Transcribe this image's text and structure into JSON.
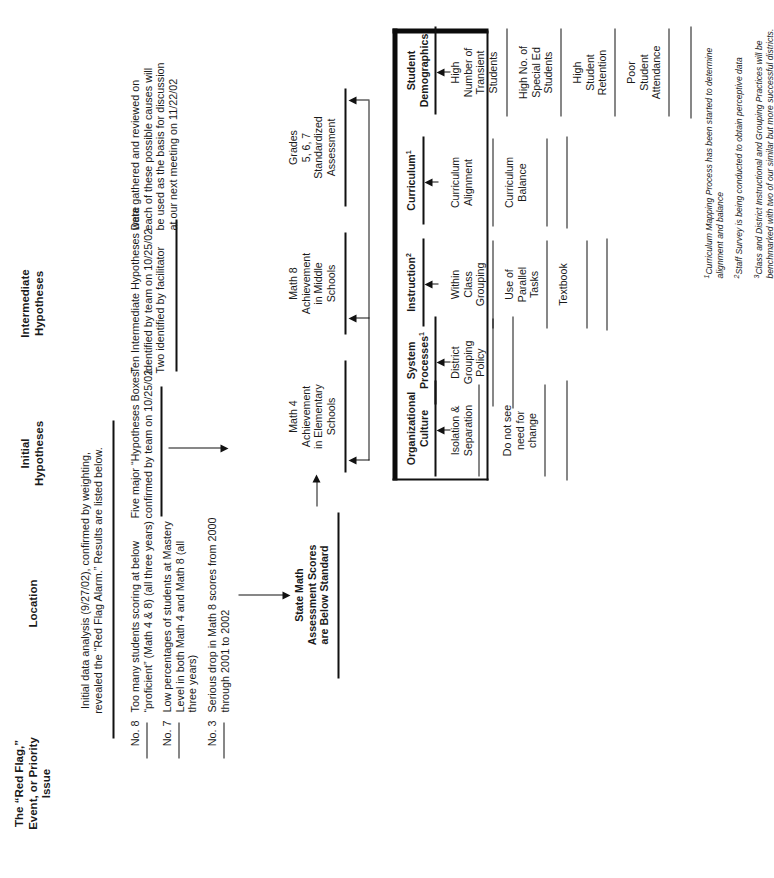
{
  "columns": [
    {
      "id": "red-flag",
      "label": "The “Red Flag,”\nEvent, or Priority\nIssue"
    },
    {
      "id": "location",
      "label": "Location"
    },
    {
      "id": "initial",
      "label": "Initial\nHypotheses"
    },
    {
      "id": "intermediate",
      "label": "Intermediate\nHypotheses"
    }
  ],
  "analysis_note": "Initial data analysis (9/27/02), confirmed by weighting,\nrevealed the “Red Flag Alarm.” Results are listed below.",
  "findings": [
    {
      "number": "No. 8",
      "text": "Too many students scoring at below\n“proficient” (Math 4 & 8) (all three years)"
    },
    {
      "number": "No. 7",
      "text": "Low percentages of students at Mastery\nLevel in both Math 4 and Math 8 (all\nthree years)"
    },
    {
      "number": "No. 3",
      "text": "Serious drop in Math 8 scores from 2000\nthrough 2001 to 2002"
    }
  ],
  "hypotheses_notes": [
    "Five major “Hypotheses Boxes”\nconfirmed by team on 10/25/02",
    "Ten Intermediate Hypotheses were\nidentified by team on 10/25/02\nTwo identified by facilitator",
    "Data gathered and reviewed on\neach of these possible causes will\nbe used as the basis for discussion\nat our next meeting on 11/22/02"
  ],
  "effect": "State Math\nAssessment Scores\nare Below Standard",
  "locations": [
    "Math 4\nAchievement\nin Elementary\nSchools",
    "Math 8\nAchievement\nin Middle\nSchools",
    "Grades\n5, 6, 7\nStandardized\nAssessment"
  ],
  "bones": [
    {
      "label": "Student\nDemographics",
      "sup": "",
      "causes": [
        "High\nNumber of\nTransient\nStudents",
        "High No. of\nSpecial Ed\nStudents",
        "High\nStudent\nRetention",
        "Poor\nStudent\nAttendance"
      ]
    },
    {
      "label": "Curriculum",
      "sup": "1",
      "causes": [
        "Curriculum\nAlignment",
        "Curriculum\nBalance"
      ]
    },
    {
      "label": "Instruction",
      "sup": "2",
      "causes": [
        "Within\nClass\nGrouping",
        "Use of\nParallel\nTasks",
        "Textbook"
      ]
    },
    {
      "label": "System\nProcesses",
      "sup": "1",
      "causes": [
        "District\nGrouping\nPolicy"
      ]
    },
    {
      "label": "Organizational\nCulture",
      "sup": "",
      "causes": [
        "Isolation &\nSeparation",
        "Do not see\nneed for\nchange"
      ]
    }
  ],
  "footnotes": [
    {
      "marker": "1",
      "text": "Curriculum Mapping Process has been started to determine\nalignment and balance"
    },
    {
      "marker": "2",
      "text": "Staff Survey is being conducted to obtain perceptive data"
    },
    {
      "marker": "3",
      "text": "Class and District Instructional and Grouping Practices will be\nbenchmarked with two of our similar but more successful districts."
    }
  ],
  "colors": {
    "ink": "#1a1a1a",
    "rule": "#111111"
  }
}
